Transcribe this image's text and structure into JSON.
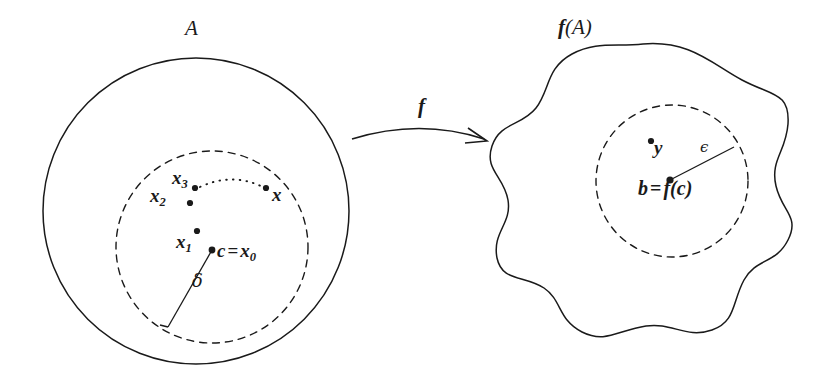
{
  "figure": {
    "kind": "math-diagram",
    "topic": "continuity-epsilon-delta",
    "background_color": "#ffffff",
    "ink_color": "#1a1a1a"
  },
  "domain_region": {
    "set_label": "A",
    "shape": "circle",
    "center": [
      196,
      211
    ],
    "radius": 153,
    "stroke": "solid"
  },
  "delta_ball": {
    "shape": "circle",
    "center": [
      212,
      247
    ],
    "radius": 96,
    "stroke": "dashed",
    "radius_label": "δ"
  },
  "codomain_region": {
    "set_label_parts": {
      "f": "f",
      "open": "(",
      "arg": "A",
      "close": ")"
    },
    "set_label": "f(A)",
    "shape": "blob",
    "stroke": "solid"
  },
  "epsilon_ball": {
    "shape": "circle",
    "center": [
      672,
      181
    ],
    "radius": 76,
    "stroke": "dashed",
    "radius_label": "ϵ"
  },
  "map_arrow": {
    "label": "f",
    "from": [
      355,
      137
    ],
    "to": [
      487,
      142
    ],
    "style": "curved-arrow"
  },
  "domain_points": [
    {
      "name": "x3",
      "base": "x",
      "subscript": "3",
      "label": "x₃",
      "dot": [
        195,
        188
      ],
      "label_pos": [
        172,
        168
      ]
    },
    {
      "name": "x2",
      "base": "x",
      "subscript": "2",
      "label": "x₂",
      "dot": [
        190,
        203
      ],
      "label_pos": [
        150,
        186
      ]
    },
    {
      "name": "x",
      "base": "x",
      "subscript": "",
      "label": "x",
      "dot": [
        266,
        188
      ],
      "label_pos": [
        272,
        185
      ]
    },
    {
      "name": "x1",
      "base": "x",
      "subscript": "1",
      "label": "x₁",
      "dot": [
        197,
        231
      ],
      "label_pos": [
        176,
        232
      ]
    },
    {
      "name": "c",
      "base": "c",
      "subscript": "",
      "label": "c = x₀",
      "dot": [
        212,
        250
      ],
      "label_pos": [
        217,
        241
      ]
    }
  ],
  "domain_center_label": {
    "c": "c",
    "equals": "=",
    "x": "x",
    "sub": "0"
  },
  "codomain_points": [
    {
      "name": "y",
      "label": "y",
      "dot": [
        651,
        141
      ],
      "label_pos": [
        654,
        138
      ]
    },
    {
      "name": "b",
      "label": "b = f(c)",
      "dot": [
        670,
        180
      ],
      "label_pos": [
        638,
        178
      ]
    }
  ],
  "codomain_center_label": {
    "b": "b",
    "equals": "=",
    "f": "f",
    "open": "(",
    "arg": "c",
    "close": ")"
  },
  "dotted_sequence_arc": {
    "description": "dotted arc from x3 toward x indicating the sequence limit",
    "from": [
      199,
      186
    ],
    "to": [
      262,
      187
    ],
    "style": "dotted"
  },
  "greek": {
    "delta": "δ",
    "epsilon": "ϵ"
  }
}
